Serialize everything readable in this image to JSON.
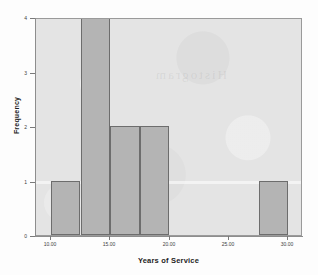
{
  "figure": {
    "background_color": "#fdfdfd",
    "plot_background_color": "#e4e4e4",
    "bar_fill_color": "#b4b4b4",
    "bar_edge_color": "#6d6d6d",
    "ghost_text": "Histogram"
  },
  "chart_data": {
    "type": "bar",
    "chart_subtype": "histogram",
    "title": "",
    "xlabel": "Years of Service",
    "ylabel": "Frequency",
    "xlim": [
      8.75,
      31.25
    ],
    "ylim": [
      0,
      4
    ],
    "grid": false,
    "legend": null,
    "bin_width": 2.5,
    "xticks": [
      10,
      15,
      20,
      25,
      30
    ],
    "xtick_labels": [
      "10.00",
      "15.00",
      "20.00",
      "25.00",
      "30.00"
    ],
    "yticks": [
      0,
      1,
      2,
      3,
      4
    ],
    "ytick_labels": [
      "0",
      "1",
      "2",
      "3",
      "4"
    ],
    "bins": [
      {
        "label": "10.0-12.5",
        "x_start": 10.0,
        "x_end": 12.5,
        "value": 1
      },
      {
        "label": "12.5-15.0",
        "x_start": 12.5,
        "x_end": 15.0,
        "value": 4
      },
      {
        "label": "15.0-17.5",
        "x_start": 15.0,
        "x_end": 17.5,
        "value": 2
      },
      {
        "label": "17.5-20.0",
        "x_start": 17.5,
        "x_end": 20.0,
        "value": 2
      },
      {
        "label": "27.5-30.0",
        "x_start": 27.5,
        "x_end": 30.0,
        "value": 1
      }
    ],
    "categories": [
      "10.0-12.5",
      "12.5-15.0",
      "15.0-17.5",
      "17.5-20.0",
      "27.5-30.0"
    ],
    "values": [
      1,
      4,
      2,
      2,
      1
    ]
  }
}
